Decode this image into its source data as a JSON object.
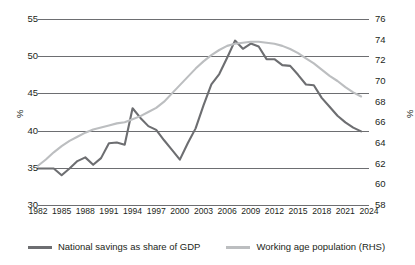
{
  "chart_data": {
    "type": "line",
    "title": "",
    "subtitle": "",
    "xlabel": "",
    "ylabel": "%",
    "ylabel_right": "%",
    "grid": true,
    "legend_position": "bottom",
    "xlim": [
      1982,
      2024
    ],
    "ylim": [
      30,
      55
    ],
    "ylim_right": [
      58,
      76
    ],
    "yticks": [
      30,
      35,
      40,
      45,
      50,
      55
    ],
    "yticks_right": [
      58,
      60,
      62,
      64,
      66,
      68,
      70,
      72,
      74,
      76
    ],
    "xticks": [
      1982,
      1985,
      1988,
      1991,
      1994,
      1997,
      2000,
      2003,
      2006,
      2009,
      2012,
      2015,
      2018,
      2021,
      2024
    ],
    "x": [
      1982,
      1983,
      1984,
      1985,
      1986,
      1987,
      1988,
      1989,
      1990,
      1991,
      1992,
      1993,
      1994,
      1995,
      1996,
      1997,
      1998,
      1999,
      2000,
      2001,
      2002,
      2003,
      2004,
      2005,
      2006,
      2007,
      2008,
      2009,
      2010,
      2011,
      2012,
      2013,
      2014,
      2015,
      2016,
      2017,
      2018,
      2019,
      2020,
      2021,
      2022,
      2023
    ],
    "series": [
      {
        "name": "National savings as share of GDP",
        "axis": "left",
        "color": "#6d6e71",
        "values": [
          34.9,
          34.9,
          34.9,
          34.0,
          34.9,
          35.9,
          36.4,
          35.4,
          36.3,
          38.3,
          38.4,
          38.1,
          43.0,
          41.7,
          40.6,
          40.1,
          38.7,
          37.4,
          36.1,
          38.3,
          40.3,
          43.4,
          46.2,
          47.6,
          49.8,
          52.1,
          51.0,
          51.7,
          51.3,
          49.6,
          49.6,
          48.8,
          48.7,
          47.5,
          46.2,
          46.1,
          44.4,
          43.2,
          42.0,
          41.1,
          40.4,
          39.9
        ]
      },
      {
        "name": "Working age population (RHS)",
        "axis": "right",
        "color": "#bcbec0",
        "values": [
          61.8,
          62.4,
          63.1,
          63.7,
          64.2,
          64.6,
          65.0,
          65.3,
          65.5,
          65.7,
          65.9,
          66.0,
          66.3,
          66.6,
          67.0,
          67.4,
          68.0,
          68.8,
          69.6,
          70.4,
          71.2,
          71.9,
          72.5,
          73.0,
          73.4,
          73.6,
          73.7,
          73.8,
          73.8,
          73.7,
          73.6,
          73.4,
          73.1,
          72.7,
          72.2,
          71.7,
          71.1,
          70.5,
          70.0,
          69.4,
          68.9,
          68.5
        ]
      }
    ]
  },
  "legend": {
    "items": [
      {
        "label": "National savings as share of GDP",
        "color": "#6d6e71"
      },
      {
        "label": "Working age population (RHS)",
        "color": "#bcbec0"
      }
    ]
  }
}
